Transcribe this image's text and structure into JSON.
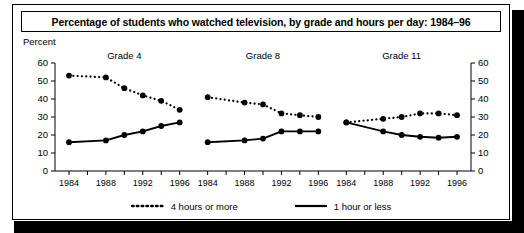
{
  "title": "Percentage of students who watched television, by grade and hours per day: 1984–96",
  "axis": {
    "y_label": "Percent",
    "y_ticks": [
      0,
      10,
      20,
      30,
      40,
      50,
      60
    ],
    "x_ticks": [
      "1984",
      "1988",
      "1992",
      "1996"
    ]
  },
  "panels": [
    {
      "label": "Grade 4"
    },
    {
      "label": "Grade 8"
    },
    {
      "label": "Grade 11"
    }
  ],
  "legend": {
    "items": [
      {
        "label": "4 hours or more",
        "style": "dotted"
      },
      {
        "label": "1 hour or less",
        "style": "solid"
      }
    ]
  },
  "chart_data": {
    "type": "line",
    "title": "Percentage of students who watched television, by grade and hours per day: 1984–96",
    "xlabel": "",
    "ylabel": "Percent",
    "ylim": [
      0,
      60
    ],
    "ytick_step": 10,
    "grid": false,
    "legend_position": "bottom",
    "dual_y_axis": true,
    "panels": [
      {
        "name": "Grade 4",
        "x": [
          1984,
          1988,
          1990,
          1992,
          1994,
          1996
        ],
        "xtick_labels": [
          "1984",
          "1988",
          "1992",
          "1996"
        ],
        "series": [
          {
            "name": "4 hours or more",
            "style": "dotted",
            "values": [
              53,
              52,
              46,
              42,
              39,
              34
            ]
          },
          {
            "name": "1 hour or less",
            "style": "solid",
            "values": [
              16,
              17,
              20,
              22,
              25,
              27
            ]
          }
        ]
      },
      {
        "name": "Grade 8",
        "x": [
          1984,
          1988,
          1990,
          1992,
          1994,
          1996
        ],
        "xtick_labels": [
          "1984",
          "1988",
          "1992",
          "1996"
        ],
        "series": [
          {
            "name": "4 hours or more",
            "style": "dotted",
            "values": [
              41,
              38,
              37,
              32,
              31,
              30
            ]
          },
          {
            "name": "1 hour or less",
            "style": "solid",
            "values": [
              16,
              17,
              18,
              22,
              22,
              22
            ]
          }
        ]
      },
      {
        "name": "Grade 11",
        "x": [
          1984,
          1988,
          1990,
          1992,
          1994,
          1996
        ],
        "xtick_labels": [
          "1984",
          "1988",
          "1992",
          "1996"
        ],
        "series": [
          {
            "name": "4 hours or more",
            "style": "dotted",
            "values": [
              27,
              29,
              30,
              32,
              32,
              31
            ]
          },
          {
            "name": "1 hour or less",
            "style": "solid",
            "values": [
              27,
              22,
              20,
              19,
              18.5,
              19
            ]
          }
        ]
      }
    ]
  }
}
